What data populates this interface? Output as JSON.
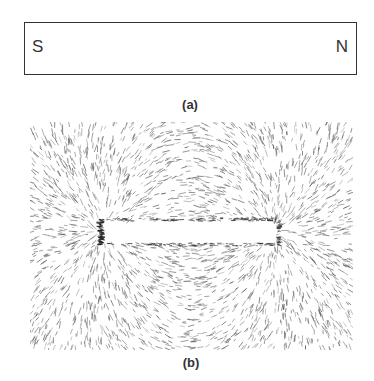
{
  "figure_a": {
    "caption": "(a)",
    "pole_left": "S",
    "pole_right": "N"
  },
  "figure_b": {
    "caption": "(b)",
    "description": "Iron filings pattern around a bar magnet showing magnetic field lines",
    "filing_color": "#555555"
  }
}
